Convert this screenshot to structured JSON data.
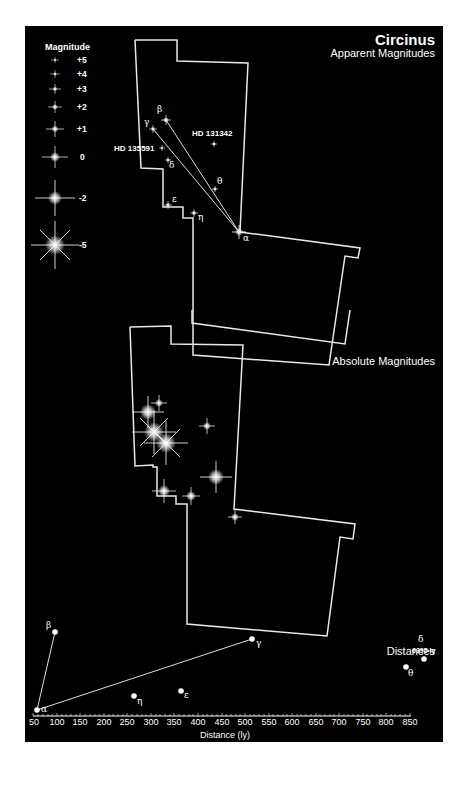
{
  "title": "Circinus",
  "subtitle": "Apparent Magnitudes",
  "sections": {
    "absolute": "Absolute Magnitudes",
    "distances": "Distances"
  },
  "legend": {
    "title": "Magnitude",
    "items": [
      {
        "label": "+5",
        "y": 60,
        "size": 3
      },
      {
        "label": "+4",
        "y": 74,
        "size": 4
      },
      {
        "label": "+3",
        "y": 89,
        "size": 5
      },
      {
        "label": "+2",
        "y": 107,
        "size": 6
      },
      {
        "label": "+1",
        "y": 129,
        "size": 8
      },
      {
        "label": "0",
        "y": 157,
        "size": 11
      },
      {
        "label": "-2",
        "y": 198,
        "size": 16
      },
      {
        "label": "-5",
        "y": 245,
        "size": 22
      }
    ]
  },
  "apparent_stars": {
    "alpha": {
      "label": "α",
      "x": 239,
      "y": 232
    },
    "beta": {
      "label": "β",
      "x": 166,
      "y": 120
    },
    "gamma": {
      "label": "γ",
      "x": 153,
      "y": 129
    },
    "delta": {
      "label": "δ",
      "x": 168,
      "y": 160
    },
    "epsilon": {
      "label": "ε",
      "x": 168,
      "y": 205
    },
    "eta": {
      "label": "η",
      "x": 194,
      "y": 213
    },
    "theta": {
      "label": "θ",
      "x": 215,
      "y": 189
    },
    "hd131342": {
      "label": "HD 131342",
      "x": 214,
      "y": 144
    },
    "hd135591": {
      "label": "HD 135591",
      "x": 162,
      "y": 148
    }
  },
  "distance_axis": {
    "title": "Distance (ly)",
    "ticks": [
      "50",
      "100",
      "150",
      "200",
      "250",
      "300",
      "350",
      "400",
      "450",
      "500",
      "550",
      "600",
      "650",
      "700",
      "750",
      "800",
      "850"
    ]
  },
  "distance_stars": {
    "alpha": {
      "label": "α",
      "ly": 53
    },
    "beta": {
      "label": "β",
      "ly": 100
    },
    "gamma": {
      "label": "γ",
      "ly": 510
    },
    "eta": {
      "label": "η",
      "ly": 265
    },
    "epsilon": {
      "label": "ε",
      "ly": 365
    },
    "theta": {
      "label": "θ",
      "ly": 840
    },
    "delta": {
      "label": "δ",
      "ly": 6395,
      "note": "6395 ly"
    }
  },
  "colors": {
    "background": "#000000",
    "foreground": "#ffffff"
  }
}
